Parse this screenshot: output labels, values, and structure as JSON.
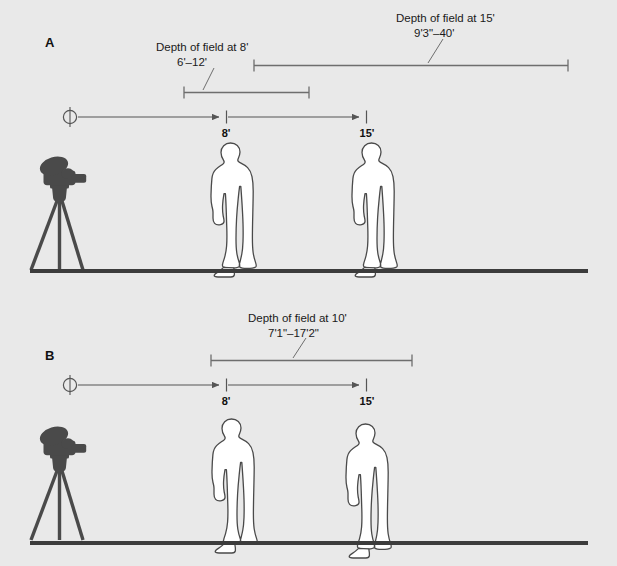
{
  "figure": {
    "background_color": "#e9e9e9",
    "ground_color": "#3c3c3c",
    "camera_color": "#4a4a4a",
    "figure_fill": "#ffffff",
    "figure_stroke": "#4a4a4a",
    "rule_color": "#6e6e6e",
    "text_color": "#1a1a1a"
  },
  "panels": [
    {
      "letter": "A",
      "dof_annotations": [
        {
          "title": "Depth of field at 8'",
          "range": "6'–12'",
          "near": "6'",
          "far": "12'",
          "focus_distance": "8'"
        },
        {
          "title": "Depth of field at 15'",
          "range": "9'3\"–40'",
          "near": "9'3\"",
          "far": "40'",
          "focus_distance": "15'"
        }
      ],
      "distance_ticks": [
        {
          "label": "8'",
          "value": 8
        },
        {
          "label": "15'",
          "value": 15
        }
      ],
      "subjects": 2,
      "camera": "movie-camera-on-tripod"
    },
    {
      "letter": "B",
      "dof_annotations": [
        {
          "title": "Depth of field at 10'",
          "range": "7'1\"–17'2\"",
          "near": "7'1\"",
          "far": "17'2\"",
          "focus_distance": "10'"
        }
      ],
      "distance_ticks": [
        {
          "label": "8'",
          "value": 8
        },
        {
          "label": "15'",
          "value": 15
        }
      ],
      "subjects": 2,
      "camera": "movie-camera-on-tripod"
    }
  ]
}
